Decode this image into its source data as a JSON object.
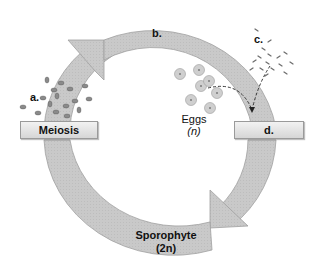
{
  "diagram": {
    "type": "life-cycle",
    "labels": {
      "a": "a.",
      "b": "b.",
      "c": "c.",
      "d": "d."
    },
    "boxes": {
      "meiosis": "Meiosis",
      "d_box": "d."
    },
    "eggs": {
      "label": "Eggs",
      "ploidy": "(n)"
    },
    "sporophyte": {
      "label": "Sporophyte",
      "ploidy": "(2n)"
    },
    "colors": {
      "cycle_arrow": "#c8c8c8",
      "cycle_arrow_edge": "#9e9e9e",
      "egg_fill": "#cfcfcf",
      "egg_nucleus": "#7a7a7a",
      "spore_fill": "#8a8a8a",
      "sperm": "#6e6e6e",
      "box_fill": "#e4e4e4"
    }
  }
}
